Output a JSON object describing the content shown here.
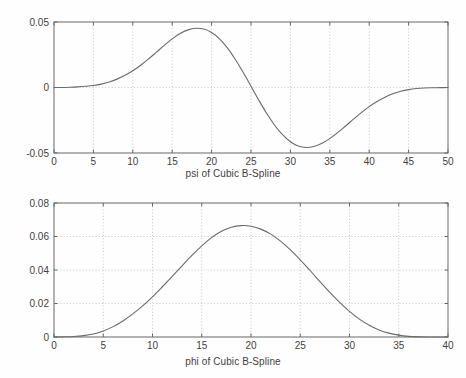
{
  "figure": {
    "background": "#fefefe",
    "curve_color": "#6a6a6a",
    "grid_color": "#b9b9b9",
    "axis_color": "#666666"
  },
  "chart_data": [
    {
      "type": "line",
      "id": "psi",
      "title": "",
      "xlabel": "psi of Cubic B-Spline",
      "ylabel": "",
      "xlim": [
        0,
        50
      ],
      "ylim": [
        -0.05,
        0.05
      ],
      "grid": true,
      "legend": null,
      "xticks": [
        0,
        5,
        10,
        15,
        20,
        25,
        30,
        35,
        40,
        45,
        50
      ],
      "xticklabels": [
        "0",
        "5",
        "10",
        "15",
        "20",
        "25",
        "30",
        "35",
        "40",
        "45",
        "50"
      ],
      "yticks": [
        -0.05,
        0,
        0.05
      ],
      "yticklabels": [
        "-0.05",
        "0",
        "0.05"
      ],
      "series": [
        {
          "name": "psi",
          "x": [
            0,
            1,
            2,
            3,
            4,
            5,
            6,
            7,
            8,
            9,
            10,
            11,
            12,
            13,
            14,
            15,
            16,
            17,
            18,
            19,
            20,
            21,
            22,
            23,
            24,
            25,
            26,
            27,
            28,
            29,
            30,
            31,
            32,
            33,
            34,
            35,
            36,
            37,
            38,
            39,
            40,
            41,
            42,
            43,
            44,
            45,
            46,
            47,
            48,
            49,
            50
          ],
          "values": [
            0.0,
            0.0,
            0.0002,
            0.0005,
            0.0009,
            0.0015,
            0.0026,
            0.0042,
            0.0064,
            0.0093,
            0.0128,
            0.017,
            0.0218,
            0.027,
            0.0322,
            0.0371,
            0.0412,
            0.044,
            0.0452,
            0.0446,
            0.042,
            0.0372,
            0.0303,
            0.0216,
            0.0116,
            0.0009,
            -0.0098,
            -0.0199,
            -0.0288,
            -0.036,
            -0.0414,
            -0.0447,
            -0.0458,
            -0.045,
            -0.0426,
            -0.039,
            -0.0345,
            -0.0294,
            -0.0242,
            -0.0192,
            -0.0146,
            -0.0107,
            -0.0074,
            -0.0048,
            -0.0029,
            -0.0016,
            -0.0008,
            -0.0004,
            -0.0002,
            -0.0001,
            0.0
          ]
        }
      ],
      "annotations": {
        "peak_x": 18,
        "peak_y": 0.045,
        "trough_x": 32,
        "trough_y": -0.046
      }
    },
    {
      "type": "line",
      "id": "phi",
      "title": "",
      "xlabel": "phi of Cubic B-Spline",
      "ylabel": "",
      "xlim": [
        0,
        40
      ],
      "ylim": [
        0,
        0.08
      ],
      "grid": true,
      "legend": null,
      "xticks": [
        0,
        5,
        10,
        15,
        20,
        25,
        30,
        35,
        40
      ],
      "xticklabels": [
        "0",
        "5",
        "10",
        "15",
        "20",
        "25",
        "30",
        "35",
        "40"
      ],
      "yticks": [
        0,
        0.02,
        0.04,
        0.06,
        0.08
      ],
      "yticklabels": [
        "0",
        "0.02",
        "0.04",
        "0.06",
        "0.08"
      ],
      "series": [
        {
          "name": "phi",
          "x": [
            0,
            1,
            2,
            3,
            4,
            5,
            6,
            7,
            8,
            9,
            10,
            11,
            12,
            13,
            14,
            15,
            16,
            17,
            18,
            19,
            20,
            21,
            22,
            23,
            24,
            25,
            26,
            27,
            28,
            29,
            30,
            31,
            32,
            33,
            34,
            35,
            36,
            37,
            38,
            39,
            40
          ],
          "values": [
            0.0,
            0.0001,
            0.0003,
            0.0008,
            0.0018,
            0.0036,
            0.0062,
            0.0096,
            0.0138,
            0.0186,
            0.024,
            0.03,
            0.0362,
            0.0425,
            0.0487,
            0.0544,
            0.0593,
            0.0631,
            0.0655,
            0.0665,
            0.0661,
            0.0644,
            0.0614,
            0.0572,
            0.052,
            0.0461,
            0.0397,
            0.0331,
            0.0267,
            0.0207,
            0.0153,
            0.0107,
            0.007,
            0.0042,
            0.0023,
            0.0011,
            0.0004,
            0.0001,
            0.0,
            0.0,
            0.0
          ]
        }
      ],
      "annotations": {
        "peak_x": 19,
        "peak_y": 0.0665
      }
    }
  ]
}
